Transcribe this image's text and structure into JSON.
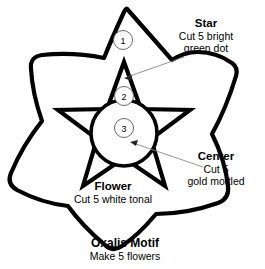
{
  "figure": {
    "title": "Oxalis Motif",
    "subtitle": "Make 5 flowers",
    "background_color": "#ffffff",
    "line_color": "#000000",
    "leader_color": "#8a8a8a"
  },
  "callouts": [
    {
      "number": "1",
      "refers_to": "Flower"
    },
    {
      "number": "2",
      "refers_to": "Star"
    },
    {
      "number": "3",
      "refers_to": "Center"
    }
  ],
  "labels": {
    "star": {
      "title": "Star",
      "line1": "Cut 5 bright",
      "line2": "green dot"
    },
    "center": {
      "title": "Center",
      "line1": "Cut 5",
      "line2": "gold mottled"
    },
    "flower": {
      "title": "Flower",
      "line1": "Cut 5 white tonal"
    }
  }
}
